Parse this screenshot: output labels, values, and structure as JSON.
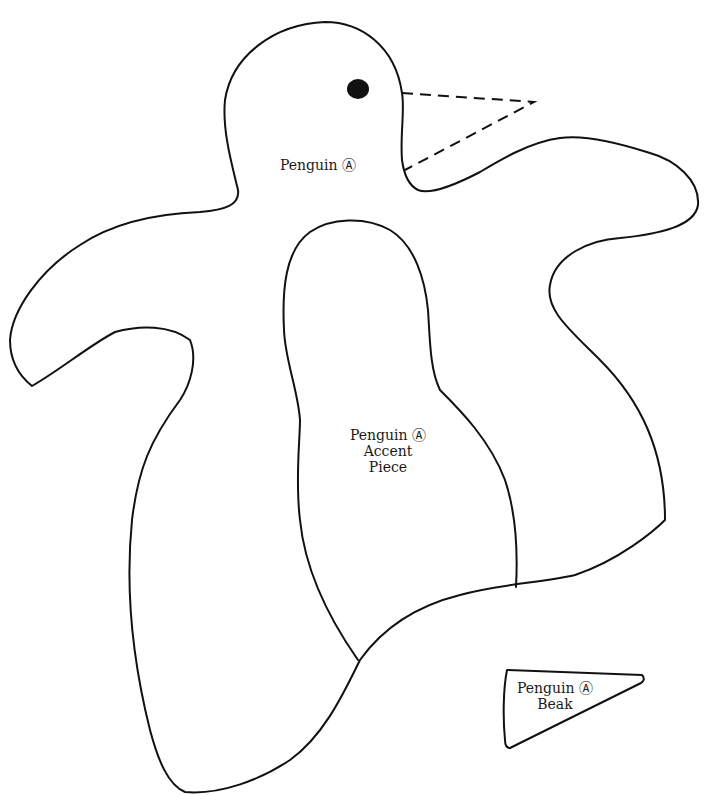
{
  "pattern": {
    "title": "Penguin pattern",
    "stroke_color": "#111111",
    "background": "#ffffff",
    "pieces": [
      {
        "name": "penguin-body",
        "label_lines": [
          "Penguin Ⓐ"
        ]
      },
      {
        "name": "penguin-accent-piece",
        "label_lines": [
          "Penguin Ⓐ",
          "Accent",
          "Piece"
        ]
      },
      {
        "name": "penguin-beak",
        "label_lines": [
          "Penguin Ⓐ",
          "Beak"
        ]
      }
    ],
    "eye": {
      "cx": 358,
      "cy": 89,
      "rx": 11,
      "ry": 10
    }
  }
}
